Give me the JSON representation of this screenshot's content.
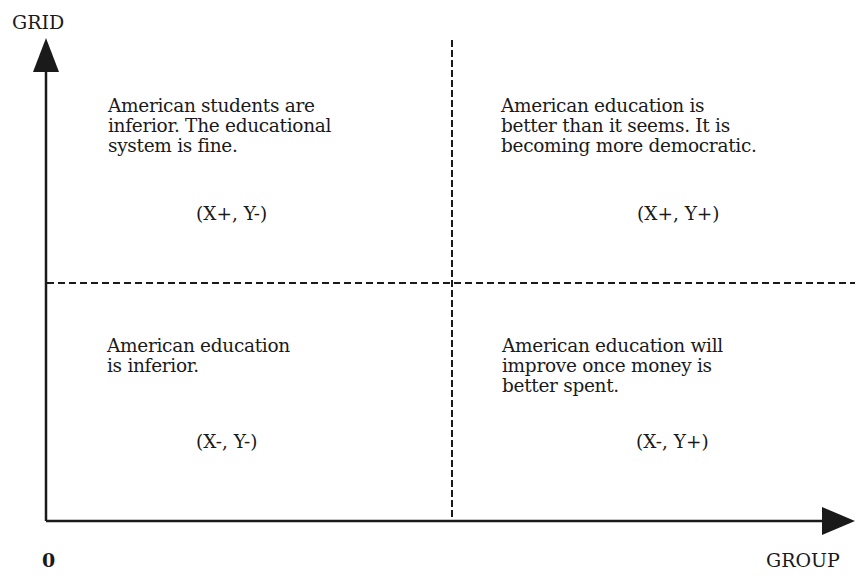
{
  "axes": {
    "y_label": "GRID",
    "x_label": "GROUP",
    "origin_label": "0"
  },
  "quadrants": {
    "top_left": {
      "text": "American students are\ninferior. The educational\nsystem is fine.",
      "coords": "(X+, Y-)"
    },
    "top_right": {
      "text": "American education is\nbetter than it seems. It is\nbecoming more democratic.",
      "coords": "(X+, Y+)"
    },
    "bottom_left": {
      "text": "American education\nis inferior.",
      "coords": "(X-, Y-)"
    },
    "bottom_right": {
      "text": "American education will\nimprove once money is\nbetter spent.",
      "coords": "(X-, Y+)"
    }
  },
  "colors": {
    "ink": "#1a1a1a",
    "background": "#ffffff"
  }
}
